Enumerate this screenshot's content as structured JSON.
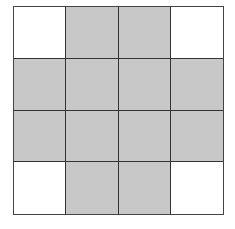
{
  "grid": {
    "rows": 4,
    "cols": 4,
    "colors": {
      "shaded": "#c8c8c8",
      "empty": "#ffffff",
      "line": "#333333"
    },
    "cells": [
      [
        0,
        1,
        1,
        0
      ],
      [
        1,
        1,
        1,
        1
      ],
      [
        1,
        1,
        1,
        1
      ],
      [
        0,
        1,
        1,
        0
      ]
    ]
  }
}
